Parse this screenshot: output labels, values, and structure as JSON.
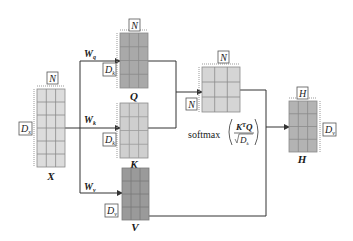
{
  "colors": {
    "input_fill": "#dcdcdc",
    "query_fill": "#a9a9a9",
    "key_fill": "#cfcfcf",
    "value_fill": "#9a9a9a",
    "attention_fill": "#d5d5d5",
    "output_fill": "#b3b3b3",
    "grid_line": "#8a8a8a",
    "connector": "#333333",
    "dim_box": "#555555"
  },
  "matrices": {
    "X": {
      "label": "X",
      "width_dim": "N",
      "height_dim": "D",
      "height_dim_sub": "x",
      "rows": 6,
      "cols": 3
    },
    "Q": {
      "label": "Q",
      "width_dim": "N",
      "height_dim": "D",
      "height_dim_sub": "k",
      "rows": 4,
      "cols": 3,
      "weight": "W",
      "weight_sub": "q"
    },
    "K": {
      "label": "K",
      "height_dim": "D",
      "height_dim_sub": "k",
      "rows": 4,
      "cols": 3,
      "weight": "W",
      "weight_sub": "k"
    },
    "V": {
      "label": "V",
      "height_dim": "D",
      "height_dim_sub": "v",
      "rows": 4,
      "cols": 3,
      "weight": "W",
      "weight_sub": "v"
    },
    "A": {
      "width_dim": "N",
      "height_dim": "N",
      "rows": 3,
      "cols": 3
    },
    "H": {
      "label": "H",
      "width_dim": "H",
      "height_dim": "D",
      "height_dim_sub": "v",
      "rows": 4,
      "cols": 3
    }
  },
  "formula": {
    "func": "softmax",
    "numerator_K": "K",
    "numerator_T": "T",
    "numerator_Q": "Q",
    "denominator": "D",
    "denominator_sub": "k"
  }
}
